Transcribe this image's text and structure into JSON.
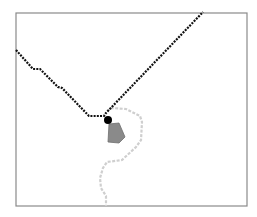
{
  "map": {
    "frame": {
      "x": 16,
      "y": 13,
      "width": 231,
      "height": 193,
      "stroke": "#8a8a8a"
    },
    "route_primary": {
      "color": "#111111",
      "points": [
        [
          16,
          50
        ],
        [
          33,
          69
        ],
        [
          40,
          69
        ],
        [
          58,
          87
        ],
        [
          62,
          88
        ],
        [
          89,
          116
        ],
        [
          104,
          116
        ],
        [
          106,
          113
        ],
        [
          203,
          12
        ]
      ]
    },
    "route_secondary": {
      "color": "#cfcfcf",
      "points": [
        [
          107,
          111
        ],
        [
          112,
          108
        ],
        [
          126,
          109
        ],
        [
          140,
          116
        ],
        [
          142,
          122
        ],
        [
          141,
          140
        ],
        [
          136,
          147
        ],
        [
          122,
          160
        ],
        [
          107,
          162
        ],
        [
          103,
          168
        ],
        [
          100,
          178
        ],
        [
          101,
          188
        ],
        [
          106,
          196
        ],
        [
          106,
          206
        ]
      ]
    },
    "marker": {
      "x": 108,
      "y": 120,
      "r": 4,
      "color": "#000000"
    },
    "area": {
      "fill": "#8a8a8a",
      "stroke": "#6e6e6e",
      "points": [
        [
          109,
          124
        ],
        [
          119,
          123
        ],
        [
          125,
          137
        ],
        [
          119,
          143
        ],
        [
          108,
          142
        ]
      ]
    }
  }
}
